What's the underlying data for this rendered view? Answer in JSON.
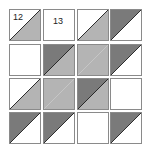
{
  "diagram": {
    "type": "quilt-block-grid",
    "rows": 4,
    "cols": 4,
    "diagonal": "bottom-left to top-right",
    "colors": {
      "white": "#ffffff",
      "light": "#b4b4b4",
      "dark": "#7a7a7a",
      "border": "#8a8a8a",
      "diagonal_line": "#1a1a1a",
      "label": "#222222"
    },
    "cells": [
      {
        "row": 0,
        "col": 0,
        "top_left": "white",
        "bottom_right": "light",
        "label": "12",
        "label_pos": "top-left"
      },
      {
        "row": 0,
        "col": 1,
        "top_left": "white",
        "bottom_right": "white",
        "label": "13",
        "label_pos": "center"
      },
      {
        "row": 0,
        "col": 2,
        "top_left": "white",
        "bottom_right": "light",
        "label": ""
      },
      {
        "row": 0,
        "col": 3,
        "top_left": "dark",
        "bottom_right": "white",
        "label": ""
      },
      {
        "row": 1,
        "col": 0,
        "top_left": "white",
        "bottom_right": "white",
        "label": ""
      },
      {
        "row": 1,
        "col": 1,
        "top_left": "dark",
        "bottom_right": "light",
        "label": ""
      },
      {
        "row": 1,
        "col": 2,
        "top_left": "light",
        "bottom_right": "light",
        "label": ""
      },
      {
        "row": 1,
        "col": 3,
        "top_left": "dark",
        "bottom_right": "white",
        "label": ""
      },
      {
        "row": 2,
        "col": 0,
        "top_left": "white",
        "bottom_right": "light",
        "label": ""
      },
      {
        "row": 2,
        "col": 1,
        "top_left": "light",
        "bottom_right": "light",
        "label": ""
      },
      {
        "row": 2,
        "col": 2,
        "top_left": "dark",
        "bottom_right": "light",
        "label": ""
      },
      {
        "row": 2,
        "col": 3,
        "top_left": "white",
        "bottom_right": "white",
        "label": ""
      },
      {
        "row": 3,
        "col": 0,
        "top_left": "dark",
        "bottom_right": "white",
        "label": ""
      },
      {
        "row": 3,
        "col": 1,
        "top_left": "dark",
        "bottom_right": "white",
        "label": ""
      },
      {
        "row": 3,
        "col": 2,
        "top_left": "white",
        "bottom_right": "white",
        "label": ""
      },
      {
        "row": 3,
        "col": 3,
        "top_left": "dark",
        "bottom_right": "white",
        "label": ""
      }
    ]
  }
}
